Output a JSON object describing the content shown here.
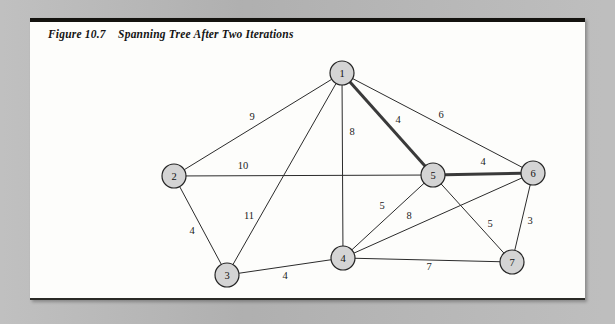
{
  "page": {
    "background_color": "#b9b9b9",
    "card_color": "#fdfdfb"
  },
  "figure": {
    "title": "Figure 10.7    Spanning Tree After Two Iterations",
    "label": "Figure 10.7",
    "caption": "Spanning Tree After Two Iterations"
  },
  "graph": {
    "node_fill": "#d4d4d4",
    "node_stroke": "#242424",
    "edge_color": "#2b2b2b",
    "tree_edge_color": "#3a3a3a",
    "nodes": [
      {
        "id": "1",
        "label": "1",
        "x": 342,
        "y": 73
      },
      {
        "id": "2",
        "label": "2",
        "x": 174,
        "y": 176
      },
      {
        "id": "3",
        "label": "3",
        "x": 227,
        "y": 275
      },
      {
        "id": "4",
        "label": "4",
        "x": 343,
        "y": 258
      },
      {
        "id": "5",
        "label": "5",
        "x": 433,
        "y": 175
      },
      {
        "id": "6",
        "label": "6",
        "x": 533,
        "y": 173
      },
      {
        "id": "7",
        "label": "7",
        "x": 512,
        "y": 262
      }
    ],
    "node_radius": 12,
    "edges": [
      {
        "from": "1",
        "to": "2",
        "weight": "9",
        "label_x": 252,
        "label_y": 118,
        "in_tree": false
      },
      {
        "from": "1",
        "to": "3",
        "weight": "11",
        "label_x": 249,
        "label_y": 217,
        "in_tree": false
      },
      {
        "from": "1",
        "to": "4",
        "weight": "8",
        "label_x": 352,
        "label_y": 133,
        "in_tree": false
      },
      {
        "from": "1",
        "to": "5",
        "weight": "4",
        "label_x": 398,
        "label_y": 121,
        "in_tree": true
      },
      {
        "from": "1",
        "to": "6",
        "weight": "6",
        "label_x": 441,
        "label_y": 116,
        "in_tree": false
      },
      {
        "from": "2",
        "to": "3",
        "weight": "4",
        "label_x": 192,
        "label_y": 232,
        "in_tree": false
      },
      {
        "from": "2",
        "to": "5",
        "weight": "10",
        "label_x": 243,
        "label_y": 167,
        "in_tree": false
      },
      {
        "from": "3",
        "to": "4",
        "weight": "4",
        "label_x": 285,
        "label_y": 277,
        "in_tree": false
      },
      {
        "from": "4",
        "to": "5",
        "weight": "5",
        "label_x": 382,
        "label_y": 207,
        "in_tree": false
      },
      {
        "from": "4",
        "to": "6",
        "weight": "8",
        "label_x": 409,
        "label_y": 217,
        "in_tree": false
      },
      {
        "from": "4",
        "to": "7",
        "weight": "7",
        "label_x": 429,
        "label_y": 268,
        "in_tree": false
      },
      {
        "from": "5",
        "to": "6",
        "weight": "4",
        "label_x": 483,
        "label_y": 163,
        "in_tree": true
      },
      {
        "from": "5",
        "to": "7",
        "weight": "5",
        "label_x": 490,
        "label_y": 225,
        "in_tree": false
      },
      {
        "from": "6",
        "to": "7",
        "weight": "3",
        "label_x": 530,
        "label_y": 222,
        "in_tree": false
      }
    ]
  }
}
